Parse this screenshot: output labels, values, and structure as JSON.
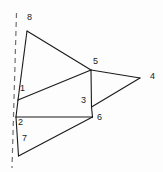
{
  "figure": {
    "width": 163,
    "height": 172,
    "background_color": "#fdfdfd",
    "line_color": "#1a1a1a",
    "dashed_line_color": "#6f6f6f",
    "label_color": "#1a1a1a"
  },
  "axis": {
    "name": "dashed-reference-line",
    "style": "dashed",
    "x1": 16.5,
    "y1": 13,
    "x2": 12.0,
    "y2": 168
  },
  "vertices": [
    {
      "id": "1",
      "label": "1",
      "x": 18.0,
      "y": 100.0,
      "label_x": 20,
      "label_y": 84
    },
    {
      "id": "2",
      "label": "2",
      "x": 16.0,
      "y": 117.0,
      "label_x": 18,
      "label_y": 118
    },
    {
      "id": "3",
      "label": "3",
      "x": 91.5,
      "y": 107.0,
      "label_x": 81,
      "label_y": 96
    },
    {
      "id": "4",
      "label": "4",
      "x": 140.0,
      "y": 78.0,
      "label_x": 150,
      "label_y": 72
    },
    {
      "id": "5",
      "label": "5",
      "x": 91.0,
      "y": 70.0,
      "label_x": 93,
      "label_y": 57
    },
    {
      "id": "6",
      "label": "6",
      "x": 92.5,
      "y": 117.0,
      "label_x": 97,
      "label_y": 113
    },
    {
      "id": "7",
      "label": "7",
      "x": 18.5,
      "y": 156.0,
      "label_x": 22,
      "label_y": 134
    },
    {
      "id": "8",
      "label": "8",
      "x": 27.0,
      "y": 31.0,
      "label_x": 27,
      "label_y": 13
    }
  ],
  "edges": [
    {
      "name": "edge-8-5",
      "from": "8",
      "to": "5"
    },
    {
      "name": "edge-8-1",
      "from": "8",
      "to": "1"
    },
    {
      "name": "edge-1-5",
      "from": "1",
      "to": "5"
    },
    {
      "name": "edge-5-3",
      "from": "5",
      "to": "3"
    },
    {
      "name": "edge-5-4",
      "from": "5",
      "to": "4"
    },
    {
      "name": "edge-4-3",
      "from": "4",
      "to": "3"
    },
    {
      "name": "edge-1-2",
      "from": "1",
      "to": "2"
    },
    {
      "name": "edge-2-6",
      "from": "2",
      "to": "6"
    },
    {
      "name": "edge-3-6",
      "from": "3",
      "to": "6"
    },
    {
      "name": "edge-2-7",
      "from": "2",
      "to": "7"
    },
    {
      "name": "edge-7-6",
      "from": "7",
      "to": "6"
    }
  ]
}
